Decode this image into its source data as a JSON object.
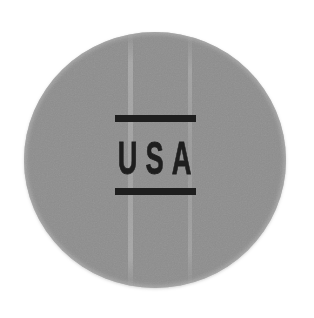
{
  "badge": {
    "label": "USA"
  },
  "colors": {
    "background": "#ffffff",
    "badge-gray": "#8e8e8e",
    "ink": "#1e1e1e"
  }
}
